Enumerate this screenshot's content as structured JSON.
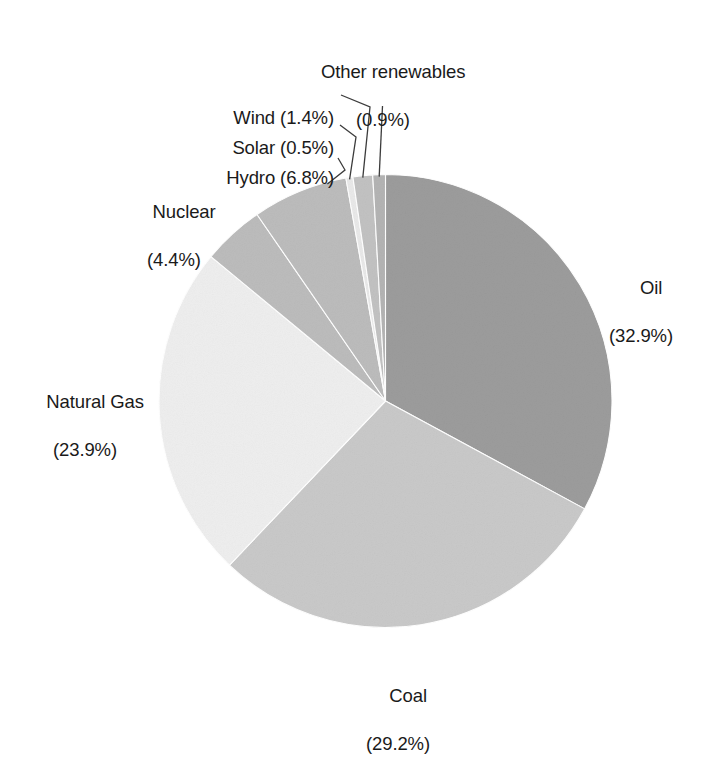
{
  "chart_data": {
    "type": "pie",
    "title": "",
    "subtitle": "",
    "xlabel": "",
    "ylabel": "",
    "legend_position": "none",
    "grid": false,
    "units": "percent",
    "total": 100.0,
    "start_angle_deg": 0,
    "direction": "clockwise",
    "categories": [
      "Oil",
      "Coal",
      "Natural Gas",
      "Nuclear",
      "Hydro",
      "Solar",
      "Wind",
      "Other renewables"
    ],
    "values": [
      32.9,
      29.2,
      23.9,
      4.4,
      6.8,
      0.5,
      1.4,
      0.9
    ],
    "slices": [
      {
        "name": "Oil",
        "value": 32.9,
        "percent_text": "(32.9%)",
        "label_text": "Oil",
        "color": "#9c9c9c",
        "start_deg": 0.0,
        "end_deg": 118.44,
        "leader": false
      },
      {
        "name": "Coal",
        "value": 29.2,
        "percent_text": "(29.2%)",
        "label_text": "Coal",
        "color": "#c9c9c9",
        "start_deg": 118.44,
        "end_deg": 223.56,
        "leader": false
      },
      {
        "name": "Natural Gas",
        "value": 23.9,
        "percent_text": "(23.9%)",
        "label_text": "Natural Gas",
        "color": "#eeeeee",
        "start_deg": 223.56,
        "end_deg": 309.6,
        "leader": false
      },
      {
        "name": "Nuclear",
        "value": 4.4,
        "percent_text": "(4.4%)",
        "label_text": "Nuclear",
        "color": "#bcbcbc",
        "start_deg": 309.6,
        "end_deg": 325.44,
        "leader": false
      },
      {
        "name": "Hydro",
        "value": 6.8,
        "percent_text": "(6.8%)",
        "label_text": "Hydro",
        "color": "#bcbcbc",
        "start_deg": 325.44,
        "end_deg": 349.92,
        "leader": true
      },
      {
        "name": "Solar",
        "value": 0.5,
        "percent_text": "(0.5%)",
        "label_text": "Solar",
        "color": "#e9e9e9",
        "start_deg": 349.92,
        "end_deg": 351.72,
        "leader": true
      },
      {
        "name": "Wind",
        "value": 1.4,
        "percent_text": "(1.4%)",
        "label_text": "Wind",
        "color": "#c2c2c2",
        "start_deg": 351.72,
        "end_deg": 356.76,
        "leader": true
      },
      {
        "name": "Other renewables",
        "value": 0.9,
        "percent_text": "(0.9%)",
        "label_text": "Other renewables",
        "color": "#b4b4b4",
        "start_deg": 356.76,
        "end_deg": 360.0,
        "leader": true
      }
    ]
  },
  "labels": {
    "other_renewables": {
      "line1": "Other renewables",
      "line2": "(0.9%)"
    },
    "wind": {
      "line1": "Wind (1.4%)"
    },
    "solar": {
      "line1": "Solar (0.5%)"
    },
    "hydro": {
      "line1": "Hydro (6.8%)"
    },
    "nuclear": {
      "line1": "Nuclear",
      "line2": "(4.4%)"
    },
    "natural_gas": {
      "line1": "Natural Gas",
      "line2": "(23.9%)"
    },
    "coal": {
      "line1": "Coal",
      "line2": "(29.2%)"
    },
    "oil": {
      "line1": "Oil",
      "line2": "(32.9%)"
    }
  },
  "colors": {
    "background": "#ffffff",
    "text": "#1a1a1a",
    "leader_line": "#3c3c3c",
    "oil": "#9c9c9c",
    "coal": "#c9c9c9",
    "natural_gas": "#eeeeee",
    "nuclear": "#bcbcbc",
    "hydro": "#bcbcbc",
    "solar": "#e9e9e9",
    "wind": "#c2c2c2",
    "other_renewables": "#b4b4b4"
  }
}
